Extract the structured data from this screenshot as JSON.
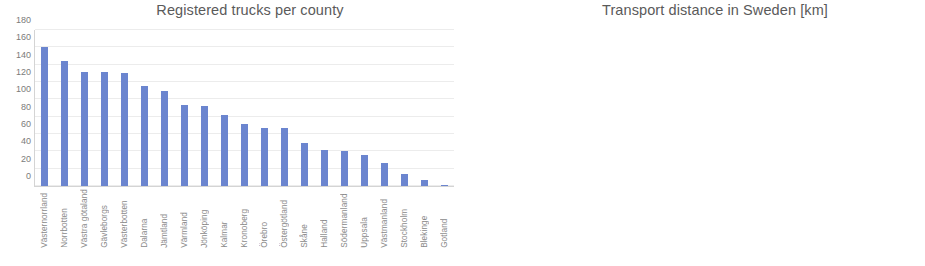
{
  "chart_data": [
    {
      "type": "bar",
      "title": "Registered trucks per county",
      "xlabel": "",
      "ylabel": "",
      "ylim": [
        0,
        180
      ],
      "yticks": [
        180,
        160,
        140,
        120,
        100,
        80,
        60,
        40,
        20,
        0
      ],
      "grid": true,
      "legend": "none",
      "bar_color": "#6b85cf",
      "categories": [
        "Västernorrland",
        "Norrbotten",
        "Västra götaland",
        "Gävleborgs",
        "Västerbotten",
        "Dalarna",
        "Jämtland",
        "Värmland",
        "Jönköping",
        "Kalmar",
        "Kronoberg",
        "Örebro",
        "Östergötland",
        "Skåne",
        "Halland",
        "Södermanland",
        "Uppsala",
        "Västmanland",
        "Stockholm",
        "Blekinge",
        "Gotland"
      ],
      "values": [
        160,
        144,
        132,
        132,
        130,
        115,
        110,
        93,
        92,
        82,
        72,
        67,
        67,
        50,
        41,
        40,
        36,
        27,
        14,
        7,
        1
      ]
    },
    {
      "type": "bar",
      "title": "Transport distance in Sweden [km]",
      "xlabel": "km",
      "ylabel": "%",
      "ylim": [
        0,
        50
      ],
      "yticks": [
        50,
        45,
        40,
        35,
        30,
        25,
        20,
        15,
        10,
        5,
        0
      ],
      "grid": true,
      "legend": "none",
      "bar_color": "#6b85cf",
      "categories": [
        "0-9",
        "10-24",
        "25-49",
        "50-99",
        "100-149",
        "150-299",
        "300-499",
        "500-"
      ],
      "values": [
        0.7,
        5.8,
        14.5,
        43.7,
        21.5,
        12.5,
        0,
        0
      ]
    }
  ]
}
